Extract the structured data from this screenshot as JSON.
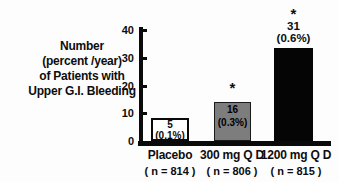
{
  "chart_data": {
    "type": "bar",
    "title": "",
    "ylabel": "Number (percent /year) of Patients with Upper G.I. Bleeding",
    "ylabel_lines": [
      "Number",
      "(percent /year)",
      "of Patients with",
      "Upper G.I. Bleeding"
    ],
    "categories": [
      "Placebo",
      "300 mg Q D",
      "1200 mg Q D"
    ],
    "n_labels": [
      "( n = 814 )",
      "( n = 806 )",
      "( n = 815 )"
    ],
    "values": [
      5,
      16,
      31
    ],
    "percent_labels": [
      "(0.1%)",
      "(0.3%)",
      "(0.6%)"
    ],
    "significance_markers": [
      "",
      "*",
      "*"
    ],
    "yticks": [
      0,
      10,
      20,
      30,
      40
    ],
    "ylim": [
      0,
      40
    ],
    "xlabel": "",
    "grid": false,
    "legend": "none",
    "bar_colors": [
      "#ffffff",
      "#7d7d7d",
      "#050505"
    ],
    "value_label_placement": [
      "inside-top",
      "inside-top",
      "above"
    ]
  }
}
